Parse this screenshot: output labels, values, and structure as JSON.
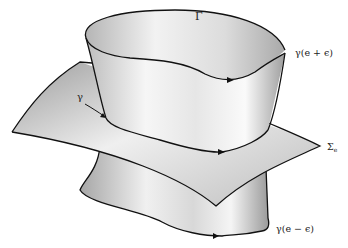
{
  "figure": {
    "labels": {
      "surface_top": "Γ",
      "curve_upper": "γ(e + ϵ)",
      "curve_middle": "γ",
      "level_surface": "Σ",
      "level_surface_sub": "e",
      "curve_lower": "γ(e − ϵ)"
    },
    "colors": {
      "stroke": "#111111",
      "shade_dark": "#a8a8a8",
      "shade_light": "#f4f4f4",
      "background": "#ffffff"
    }
  }
}
